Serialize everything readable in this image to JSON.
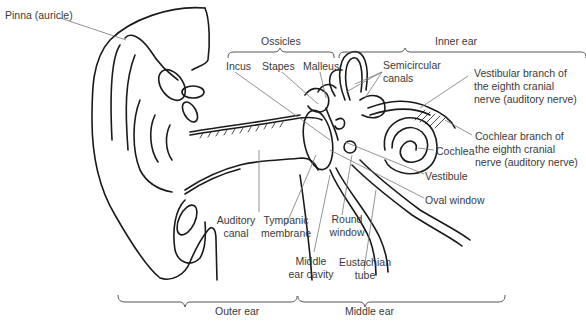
{
  "diagram": {
    "labels": {
      "pinna": "Pinna (auricle)",
      "ossicles": "Ossicles",
      "inner_ear": "Inner ear",
      "incus": "Incus",
      "stapes": "Stapes",
      "malleus": "Malleus",
      "semicircular_1": "Semicircular",
      "semicircular_2": "canals",
      "vestibular_1": "Vestibular branch of",
      "vestibular_2": "the eighth cranial",
      "vestibular_3": "nerve (auditory nerve)",
      "cochlear_1": "Cochlear branch of",
      "cochlear_2": "the eighth cranial",
      "cochlear_3": "nerve (auditory nerve)",
      "cochlea": "Cochlea",
      "vestibule": "Vestibule",
      "oval_window": "Oval window",
      "auditory_1": "Auditory",
      "auditory_2": "canal",
      "tympanic_1": "Tympanic",
      "tympanic_2": "membrane",
      "round_1": "Round",
      "round_2": "window",
      "middle_cavity_1": "Middle",
      "middle_cavity_2": "ear cavity",
      "eustachian_1": "Eustachian",
      "eustachian_2": "tube",
      "outer_ear": "Outer ear",
      "middle_ear": "Middle ear"
    },
    "colors": {
      "line": "#1a1a1a",
      "leader": "#777777",
      "text": "#3a3a3a"
    }
  }
}
